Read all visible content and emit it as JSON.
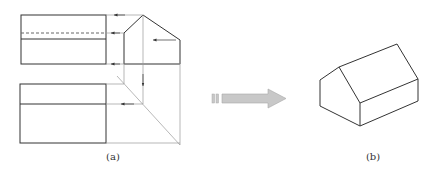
{
  "labels": {
    "a": "(a)",
    "b": "(b)"
  },
  "colors": {
    "line": "#333333",
    "construction": "#888888",
    "arrow_fill": "#c8c8c8",
    "arrow_stroke": "#a8a8a8"
  },
  "figure_a": {
    "description": "Orthographic views of a gable-roof block: front view (top-left), side view (top-right), top view (bottom-left), with 45° miter projection line",
    "front_view": {
      "x1": 21,
      "y1": 15,
      "x2": 106,
      "y2": 64,
      "dashed_y": 33,
      "solid_y": 39
    },
    "top_view": {
      "x1": 20,
      "y1": 84,
      "x2": 106,
      "y2": 143,
      "inner_y": 104
    },
    "side_view": {
      "points": [
        [
          124,
          64
        ],
        [
          124,
          33
        ],
        [
          143,
          15
        ],
        [
          180,
          40
        ],
        [
          180,
          64
        ]
      ],
      "ridge_x": 143
    }
  },
  "figure_b": {
    "description": "Isometric view of gable-roof block"
  },
  "transition_arrow": {
    "direction": "right"
  }
}
